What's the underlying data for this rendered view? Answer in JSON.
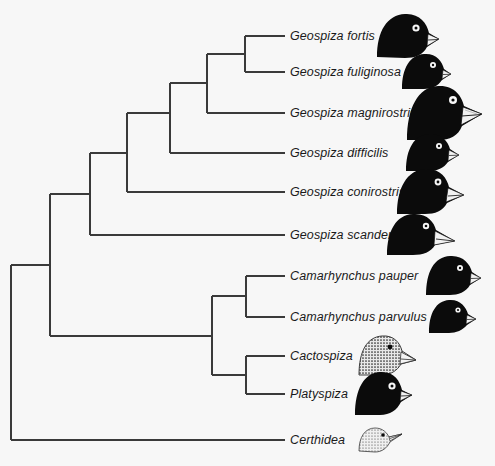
{
  "figure": {
    "background_color": "#f7f7f7",
    "line_color": "#3a3a3a",
    "text_color": "#1a1a1a"
  },
  "taxa": [
    {
      "id": "geospiza-fortis",
      "label": "Geospiza fortis",
      "tip_y": 36,
      "label_x": 290,
      "bird": {
        "name": "geospiza-fortis-head-illustration",
        "x": 375,
        "width": 66,
        "height": 50,
        "style": "black-silhouette",
        "beak": "medium-deep-conical"
      }
    },
    {
      "id": "geospiza-fuliginosa",
      "label": "Geospiza fuliginosa",
      "tip_y": 72,
      "label_x": 290,
      "bird": {
        "name": "geospiza-fuliginosa-head-illustration",
        "x": 400,
        "width": 52,
        "height": 40,
        "style": "black-silhouette",
        "beak": "small-conical"
      }
    },
    {
      "id": "geospiza-magnirostris",
      "label": "Geospiza magnirostris",
      "tip_y": 113,
      "label_x": 290,
      "bird": {
        "name": "geospiza-magnirostris-head-illustration",
        "x": 404,
        "width": 80,
        "height": 62,
        "style": "black-silhouette",
        "beak": "very-large-deep"
      }
    },
    {
      "id": "geospiza-difficilis",
      "label": "Geospiza difficilis",
      "tip_y": 153,
      "label_x": 290,
      "bird": {
        "name": "geospiza-difficilis-head-illustration",
        "x": 404,
        "width": 56,
        "height": 42,
        "style": "black-silhouette",
        "beak": "small-pointed"
      }
    },
    {
      "id": "geospiza-conirostris",
      "label": "Geospiza conirostris",
      "tip_y": 192,
      "label_x": 290,
      "bird": {
        "name": "geospiza-conirostris-head-illustration",
        "x": 395,
        "width": 70,
        "height": 52,
        "style": "black-silhouette",
        "beak": "long-pointed-conical"
      }
    },
    {
      "id": "geospiza-scandens",
      "label": "Geospiza scandens",
      "tip_y": 235,
      "label_x": 290,
      "bird": {
        "name": "geospiza-scandens-head-illustration",
        "x": 385,
        "width": 72,
        "height": 48,
        "style": "black-silhouette",
        "beak": "long-slender-decurved"
      }
    },
    {
      "id": "camarhynchus-pauper",
      "label": "Camarhynchus pauper",
      "tip_y": 276,
      "label_x": 290,
      "bird": {
        "name": "camarhynchus-pauper-head-illustration",
        "x": 424,
        "width": 58,
        "height": 44,
        "style": "black-silhouette",
        "beak": "medium-conical"
      }
    },
    {
      "id": "camarhynchus-parvulus",
      "label": "Camarhynchus parvulus",
      "tip_y": 317,
      "label_x": 290,
      "bird": {
        "name": "camarhynchus-parvulus-head-illustration",
        "x": 427,
        "width": 50,
        "height": 38,
        "style": "black-silhouette",
        "beak": "small-conical"
      }
    },
    {
      "id": "cactospiza",
      "label": "Cactospiza",
      "tip_y": 356,
      "label_x": 290,
      "bird": {
        "name": "cactospiza-head-illustration",
        "x": 356,
        "width": 62,
        "height": 46,
        "style": "stippled-grey",
        "beak": "long-straight"
      }
    },
    {
      "id": "platyspiza",
      "label": "Platyspiza",
      "tip_y": 394,
      "label_x": 290,
      "bird": {
        "name": "platyspiza-head-illustration",
        "x": 352,
        "width": 62,
        "height": 50,
        "style": "black-silhouette",
        "beak": "stubby-parrot-like"
      }
    },
    {
      "id": "certhidea",
      "label": "Certhidea",
      "tip_y": 440,
      "label_x": 290,
      "bird": {
        "name": "certhidea-head-illustration",
        "x": 356,
        "width": 48,
        "height": 34,
        "style": "light-stippled",
        "beak": "thin-warbler-like"
      }
    }
  ],
  "tree_topology": {
    "root_x": 11,
    "tip_x": 285,
    "nodes": [
      {
        "id": "node-fortis-fuliginosa",
        "x": 245,
        "children_y": [
          36,
          72
        ]
      },
      {
        "id": "node-magnirostris-clade",
        "x": 207,
        "children_y": [
          54,
          113
        ]
      },
      {
        "id": "node-difficilis-clade",
        "x": 170,
        "children_y": [
          83,
          153
        ]
      },
      {
        "id": "node-conirostris-clade",
        "x": 127,
        "children_y": [
          113,
          192
        ]
      },
      {
        "id": "node-scandens-clade",
        "x": 90,
        "children_y": [
          153,
          235
        ]
      },
      {
        "id": "node-pauper-parvulus",
        "x": 246,
        "children_y": [
          276,
          317
        ]
      },
      {
        "id": "node-cactospiza-platyspiza",
        "x": 246,
        "children_y": [
          356,
          394
        ]
      },
      {
        "id": "node-tree-finch-clade",
        "x": 212,
        "children_y": [
          296,
          375
        ]
      },
      {
        "id": "node-ground-tree-split",
        "x": 50,
        "children_y": [
          194,
          336
        ]
      },
      {
        "id": "node-root-certhidea",
        "x": 11,
        "children_y": [
          265,
          440
        ]
      }
    ]
  }
}
